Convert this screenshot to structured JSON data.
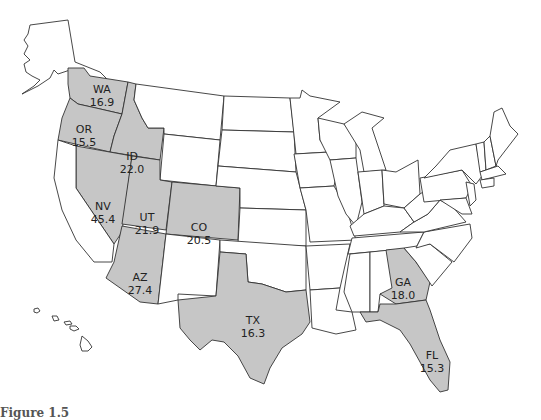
{
  "map": {
    "title": "US states map with highlighted values",
    "highlight_color": "#c6c6c6",
    "default_color": "#ffffff",
    "highlighted_states": [
      {
        "abbr": "WA",
        "value": "16.9"
      },
      {
        "abbr": "OR",
        "value": "15.5"
      },
      {
        "abbr": "ID",
        "value": "22.0"
      },
      {
        "abbr": "NV",
        "value": "45.4"
      },
      {
        "abbr": "UT",
        "value": "21.9"
      },
      {
        "abbr": "CO",
        "value": "20.5"
      },
      {
        "abbr": "AZ",
        "value": "27.4"
      },
      {
        "abbr": "TX",
        "value": "16.3"
      },
      {
        "abbr": "GA",
        "value": "18.0"
      },
      {
        "abbr": "FL",
        "value": "15.3"
      }
    ]
  },
  "caption": {
    "label": "Figure 1.5",
    "text": ""
  }
}
